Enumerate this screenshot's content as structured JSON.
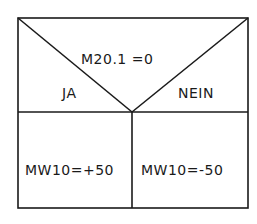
{
  "diagram": {
    "type": "structogram-decision",
    "condition": "M20.1 =0",
    "branches": {
      "yes_label": "JA",
      "no_label": "NEIN"
    },
    "actions": {
      "yes": "MW10=+50",
      "no": "MW10=-50"
    },
    "line_color": "#1a1a1a"
  }
}
